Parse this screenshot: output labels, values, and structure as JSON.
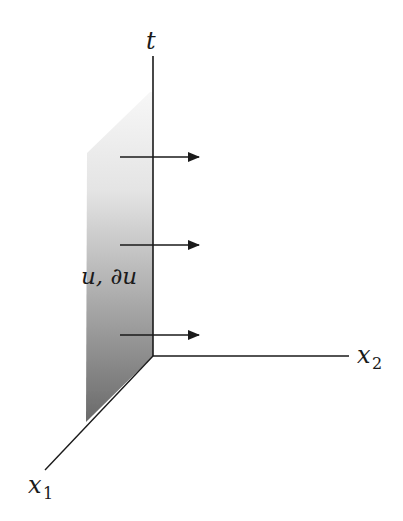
{
  "diagram": {
    "type": "3d-axes-with-boundary-plane",
    "axes": [
      {
        "id": "t",
        "label": "t",
        "subscript": "",
        "direction": "up"
      },
      {
        "id": "x2",
        "label": "x",
        "subscript": "2",
        "direction": "right"
      },
      {
        "id": "x1",
        "label": "x",
        "subscript": "1",
        "direction": "down-left"
      }
    ],
    "plane": {
      "description": "shaded plane in the t–x1 plane (x2 = 0), gradient from light at top to dark at bottom",
      "label": "u, ∂u",
      "gradient_top": "#f4f4f4",
      "gradient_bottom": "#6e6e6e"
    },
    "arrows": {
      "count": 3,
      "direction": "+x2",
      "description": "arrows pointing in the positive x2 direction from the plane"
    },
    "colors": {
      "line": "#1a1a1a",
      "background": "#ffffff"
    }
  }
}
